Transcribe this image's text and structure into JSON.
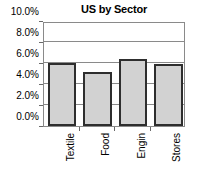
{
  "chart_data": {
    "type": "bar",
    "title": "US by Sector",
    "xlabel": "",
    "ylabel": "",
    "categories": [
      "Textile",
      "Food",
      "Engin",
      "Stores"
    ],
    "values": [
      6.0,
      5.1,
      6.4,
      5.95
    ],
    "value_suffix": "%",
    "ylim": [
      0.0,
      10.0
    ],
    "ytick_values": [
      0.0,
      2.0,
      4.0,
      6.0,
      8.0,
      10.0
    ],
    "ytick_labels": [
      "0.0%",
      "2.0%",
      "4.0%",
      "6.0%",
      "8.0%",
      "10.0%"
    ],
    "grid": true,
    "legend": false,
    "legend_position": "none",
    "series": [
      {
        "name": "US by Sector",
        "values": [
          6.0,
          5.1,
          6.4,
          5.95
        ],
        "bar_fill_color": "#d2d2d2",
        "bar_edge_color": "#2e2e2e"
      }
    ],
    "colors": {
      "bar_fill": "#d2d2d2",
      "bar_edge": "#2e2e2e",
      "grid": "#8a8a8a",
      "frame": "#8a8a8a",
      "text": "#000000",
      "background": "#ffffff"
    }
  }
}
